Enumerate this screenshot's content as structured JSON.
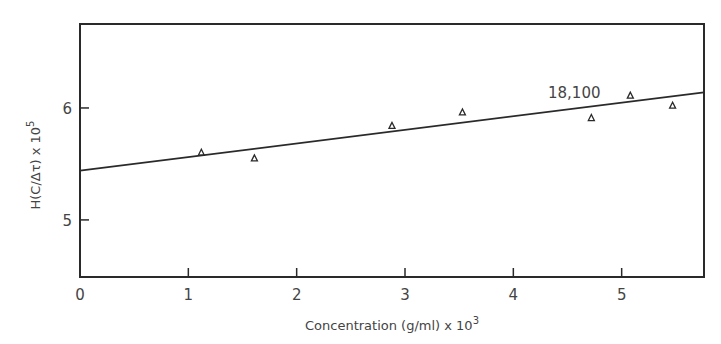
{
  "chart_data": {
    "type": "scatter",
    "title": "",
    "xlabel": "Concentration (g/ml) x 10",
    "xlabel_exp": "3",
    "ylabel": "H(C/Δτ) x 10",
    "ylabel_exp": "5",
    "xlim": [
      0,
      5.76
    ],
    "ylim": [
      4.49,
      6.75
    ],
    "x_ticks": [
      0,
      1,
      2,
      3,
      4,
      5
    ],
    "x_tick_labels": [
      "0",
      "1",
      "2",
      "3",
      "4",
      "5"
    ],
    "y_ticks": [
      5,
      6
    ],
    "y_tick_labels": [
      "5",
      "6"
    ],
    "grid": false,
    "legend": null,
    "series": [
      {
        "name": "data",
        "marker": "triangle-open",
        "x": [
          1.12,
          1.61,
          2.88,
          3.53,
          4.72,
          5.08,
          5.47
        ],
        "y": [
          5.6,
          5.55,
          5.84,
          5.96,
          5.91,
          6.11,
          6.02
        ]
      },
      {
        "name": "fit",
        "style": "line",
        "x": [
          0,
          5.76
        ],
        "y": [
          5.44,
          6.14
        ]
      }
    ],
    "annotations": [
      {
        "text": "18,100",
        "x": 4.32,
        "y": 6.13
      }
    ]
  }
}
